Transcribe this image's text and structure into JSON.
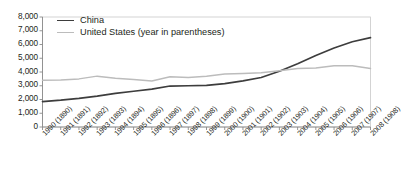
{
  "chart_data": {
    "type": "line",
    "title": "",
    "subtitle": "",
    "xlabel": "",
    "ylabel": "",
    "ylim": [
      0,
      8000
    ],
    "ytick_values": [
      0,
      1000,
      2000,
      3000,
      4000,
      5000,
      6000,
      7000,
      8000
    ],
    "ytick_labels": [
      "0",
      "1,000",
      "2,000",
      "3,000",
      "4,000",
      "5,000",
      "6,000",
      "7,000",
      "8,000"
    ],
    "grid": false,
    "legend_position": "top-left",
    "categories": [
      "1990 (1890)",
      "1991 (1891)",
      "1992 (1892)",
      "1993 (1893)",
      "1994 (1894)",
      "1995 (1895)",
      "1996 (1896)",
      "1997 (1897)",
      "1998 (1898)",
      "1999 (1899)",
      "2000 (1900)",
      "2001 (1901)",
      "2002 (1902)",
      "2003 (1903)",
      "2004 (1904)",
      "2005 (1905)",
      "2006 (1906)",
      "2007 (1907)",
      "2008 (1908)"
    ],
    "series": [
      {
        "name": "China",
        "color": "#3d3d3d",
        "values": [
          1850,
          1950,
          2080,
          2250,
          2450,
          2600,
          2750,
          2980,
          3000,
          3020,
          3150,
          3350,
          3600,
          4050,
          4600,
          5200,
          5750,
          6200,
          6500
        ]
      },
      {
        "name": "United States (year in parentheses)",
        "color": "#bcbcbc",
        "values": [
          3400,
          3420,
          3500,
          3700,
          3550,
          3450,
          3350,
          3650,
          3600,
          3700,
          3850,
          3900,
          3950,
          4100,
          4250,
          4300,
          4450,
          4450,
          4250
        ]
      }
    ]
  },
  "legend": {
    "items": [
      {
        "label": "China",
        "color": "#3d3d3d"
      },
      {
        "label": "United States (year in parentheses)",
        "color": "#bcbcbc"
      }
    ]
  }
}
